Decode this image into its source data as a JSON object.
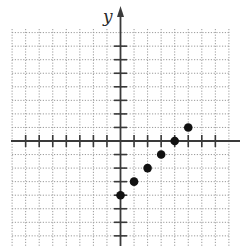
{
  "chart_data": {
    "type": "scatter",
    "title": "",
    "xlabel": "",
    "ylabel": "y",
    "xlim": [
      -8,
      8
    ],
    "ylim": [
      -8,
      8
    ],
    "grid": true,
    "grid_style": "dotted",
    "x_ticks": [
      -7,
      -6,
      -5,
      -4,
      -3,
      -2,
      -1,
      1,
      2,
      3,
      4,
      5,
      6,
      7
    ],
    "y_ticks": [
      -7,
      -6,
      -5,
      -4,
      -3,
      -2,
      -1,
      1,
      2,
      3,
      4,
      5,
      6,
      7
    ],
    "tick_labels_shown": false,
    "legend": null,
    "points": [
      {
        "x": 0,
        "y": -4
      },
      {
        "x": 1,
        "y": -3
      },
      {
        "x": 2,
        "y": -2
      },
      {
        "x": 3,
        "y": -1
      },
      {
        "x": 4,
        "y": 0
      },
      {
        "x": 5,
        "y": 1
      }
    ]
  },
  "labels": {
    "y_axis": "y"
  },
  "colors": {
    "axis": "#3a3a3a",
    "grid": "#9a9a9a",
    "point": "#111111"
  },
  "geometry": {
    "origin_x": 120.5,
    "origin_y": 141,
    "unit": 13.55,
    "grid_left": 12,
    "grid_right": 229,
    "grid_top": 29,
    "grid_bottom": 246
  }
}
